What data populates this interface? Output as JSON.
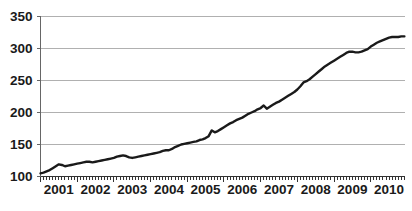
{
  "chart_data": {
    "type": "line",
    "title": "",
    "subtitle": "",
    "xlabel": "",
    "ylabel": "",
    "xlim": [
      2001.0,
      2010.92
    ],
    "ylim": [
      100,
      350
    ],
    "grid": true,
    "grid_axis": "y",
    "legend": false,
    "legend_position": "none",
    "line_color": "#1a1a1a",
    "grid_color": "#b0b0b0",
    "axis_color": "#666666",
    "background_color": "#ffffff",
    "ytick_labels": [
      "100",
      "150",
      "200",
      "250",
      "300",
      "350"
    ],
    "ytick_values": [
      100,
      150,
      200,
      250,
      300,
      350
    ],
    "xtick_labels": [
      "2001",
      "2002",
      "2003",
      "2004",
      "2005",
      "2006",
      "2007",
      "2008",
      "2009",
      "2010"
    ],
    "xtick_values": [
      2001,
      2002,
      2003,
      2004,
      2005,
      2006,
      2007,
      2008,
      2009,
      2010
    ],
    "minor_ticks": "monthly",
    "x_frequency": "monthly",
    "series": [
      {
        "name": "series-1",
        "x": [
          2001.0,
          2001.083,
          2001.167,
          2001.25,
          2001.333,
          2001.417,
          2001.5,
          2001.583,
          2001.667,
          2001.75,
          2001.833,
          2001.917,
          2002.0,
          2002.083,
          2002.167,
          2002.25,
          2002.333,
          2002.417,
          2002.5,
          2002.583,
          2002.667,
          2002.75,
          2002.833,
          2002.917,
          2003.0,
          2003.083,
          2003.167,
          2003.25,
          2003.333,
          2003.417,
          2003.5,
          2003.583,
          2003.667,
          2003.75,
          2003.833,
          2003.917,
          2004.0,
          2004.083,
          2004.167,
          2004.25,
          2004.333,
          2004.417,
          2004.5,
          2004.583,
          2004.667,
          2004.75,
          2004.833,
          2004.917,
          2005.0,
          2005.083,
          2005.167,
          2005.25,
          2005.333,
          2005.417,
          2005.5,
          2005.583,
          2005.667,
          2005.75,
          2005.833,
          2005.917,
          2006.0,
          2006.083,
          2006.167,
          2006.25,
          2006.333,
          2006.417,
          2006.5,
          2006.583,
          2006.667,
          2006.75,
          2006.833,
          2006.917,
          2007.0,
          2007.083,
          2007.167,
          2007.25,
          2007.333,
          2007.417,
          2007.5,
          2007.583,
          2007.667,
          2007.75,
          2007.833,
          2007.917,
          2008.0,
          2008.083,
          2008.167,
          2008.25,
          2008.333,
          2008.417,
          2008.5,
          2008.583,
          2008.667,
          2008.75,
          2008.833,
          2008.917,
          2009.0,
          2009.083,
          2009.167,
          2009.25,
          2009.333,
          2009.417,
          2009.5,
          2009.583,
          2009.667,
          2009.75,
          2009.833,
          2009.917,
          2010.0,
          2010.083,
          2010.167,
          2010.25,
          2010.333,
          2010.417,
          2010.5,
          2010.583,
          2010.667,
          2010.75,
          2010.833,
          2010.917
        ],
        "values": [
          105,
          106,
          108,
          110,
          113,
          116,
          119,
          118,
          116,
          117,
          118,
          119,
          120,
          121,
          122,
          123,
          123,
          122,
          123,
          124,
          125,
          126,
          127,
          128,
          129,
          131,
          132,
          133,
          132,
          130,
          129,
          130,
          131,
          132,
          133,
          134,
          135,
          136,
          137,
          138,
          140,
          141,
          141,
          143,
          146,
          148,
          150,
          151,
          152,
          153,
          154,
          155,
          157,
          158,
          160,
          163,
          172,
          169,
          171,
          174,
          177,
          180,
          183,
          185,
          188,
          190,
          192,
          195,
          198,
          200,
          202,
          205,
          207,
          211,
          206,
          209,
          212,
          215,
          217,
          220,
          223,
          226,
          229,
          232,
          236,
          241,
          247,
          249,
          252,
          256,
          260,
          264,
          268,
          272,
          275,
          278,
          281,
          284,
          287,
          290,
          293,
          295,
          295,
          294,
          294,
          295,
          297,
          299,
          303,
          306,
          309,
          311,
          313,
          315,
          317,
          318,
          318,
          318,
          319,
          319
        ]
      }
    ]
  }
}
